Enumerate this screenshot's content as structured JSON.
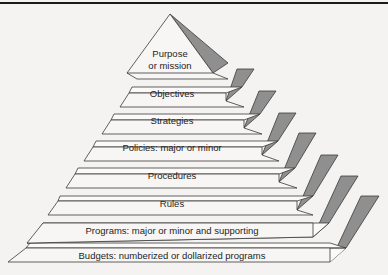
{
  "diagram": {
    "type": "pyramid",
    "levels": [
      {
        "label_lines": [
          "Purpose",
          "or mission"
        ]
      },
      {
        "label_lines": [
          "Objectives"
        ]
      },
      {
        "label_lines": [
          "Strategies"
        ]
      },
      {
        "label_lines": [
          "Policies: major or minor"
        ]
      },
      {
        "label_lines": [
          "Procedures"
        ]
      },
      {
        "label_lines": [
          "Rules"
        ]
      },
      {
        "label_lines": [
          "Programs: major or minor and supporting"
        ]
      },
      {
        "label_lines": [
          "Budgets: numberized or dollarized programs"
        ]
      }
    ],
    "colors": {
      "face": "#f7f6f4",
      "ledge": "#fbfaf8",
      "side": "#8f8f8f",
      "outline": "#3a3a3a",
      "background": "#f4f3f1"
    }
  }
}
